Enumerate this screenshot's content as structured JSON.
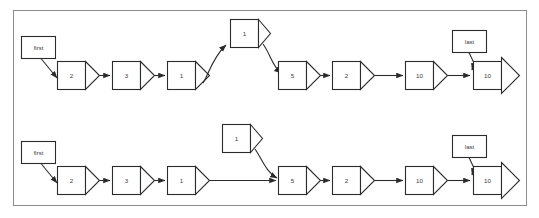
{
  "diagram": {
    "border_color": "#8c8c8c",
    "stroke_color": "#2b2b2b",
    "background_color": "#ffffff",
    "rows": [
      {
        "id": "top-row",
        "description": "Linked list with node spliced in above the chain",
        "head_label": "first",
        "tail_label": "last",
        "nodes": [
          {
            "value": "2"
          },
          {
            "value": "3"
          },
          {
            "value": "1"
          },
          {
            "value": "5"
          },
          {
            "value": "2"
          },
          {
            "value": "10"
          },
          {
            "value": "10"
          }
        ],
        "elevated_node": {
          "value": "1",
          "connected": "true"
        }
      },
      {
        "id": "bottom-row",
        "description": "Linked list with node detached above the chain",
        "head_label": "first",
        "tail_label": "last",
        "nodes": [
          {
            "value": "2"
          },
          {
            "value": "3"
          },
          {
            "value": "1"
          },
          {
            "value": "5"
          },
          {
            "value": "2"
          },
          {
            "value": "10"
          },
          {
            "value": "10"
          }
        ],
        "elevated_node": {
          "value": "1",
          "connected": "false"
        }
      }
    ]
  }
}
